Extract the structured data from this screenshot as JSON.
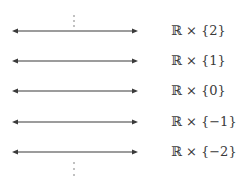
{
  "diagram": {
    "colors": {
      "line": "#3a3a3a",
      "text": "#3a3a3a",
      "background": "#ffffff"
    },
    "continuation_top": "⋮",
    "continuation_bottom": "⋮",
    "rows": [
      {
        "label": "ℝ × {2}"
      },
      {
        "label": "ℝ × {1}"
      },
      {
        "label": "ℝ × {0}"
      },
      {
        "label": "ℝ × {−1}"
      },
      {
        "label": "ℝ × {−2}"
      }
    ]
  }
}
